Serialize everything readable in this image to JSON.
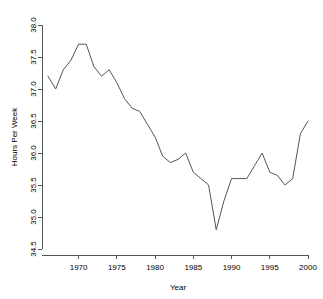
{
  "chart_data": {
    "type": "line",
    "title": "",
    "xlabel": "Year",
    "ylabel": "Hours Per Week",
    "xlim": [
      1966,
      2000
    ],
    "ylim": [
      34.5,
      38.0
    ],
    "grid": false,
    "legend": null,
    "xticks": [
      1970,
      1975,
      1980,
      1985,
      1990,
      1995,
      2000
    ],
    "xtick_labels": [
      "1970",
      "1975",
      "1980",
      "1985",
      "1990",
      "1995",
      "2000"
    ],
    "yticks": [
      34.5,
      35.0,
      35.5,
      36.0,
      36.5,
      37.0,
      37.5,
      38.0
    ],
    "ytick_labels": [
      "34.5",
      "35.0",
      "35.5",
      "36.0",
      "36.5",
      "37.0",
      "37.5",
      "38.0"
    ],
    "line_color": "#555555",
    "x": [
      1966,
      1967,
      1968,
      1969,
      1970,
      1971,
      1972,
      1973,
      1974,
      1975,
      1976,
      1977,
      1978,
      1979,
      1980,
      1981,
      1982,
      1983,
      1984,
      1985,
      1986,
      1987,
      1988,
      1989,
      1990,
      1991,
      1992,
      1993,
      1994,
      1995,
      1996,
      1997,
      1998,
      1999,
      2000
    ],
    "values": [
      37.2,
      37.0,
      37.3,
      37.45,
      37.7,
      37.7,
      37.35,
      37.2,
      37.3,
      37.1,
      36.85,
      36.7,
      36.65,
      36.45,
      36.25,
      35.95,
      35.85,
      35.9,
      36.0,
      35.7,
      35.6,
      35.5,
      34.8,
      35.25,
      35.6,
      35.6,
      35.6,
      35.8,
      36.0,
      35.7,
      35.65,
      35.5,
      35.6,
      36.3,
      36.5
    ],
    "series": [
      {
        "name": "Hours Per Week",
        "values": [
          37.2,
          37.0,
          37.3,
          37.45,
          37.7,
          37.7,
          37.35,
          37.2,
          37.3,
          37.1,
          36.85,
          36.7,
          36.65,
          36.45,
          36.25,
          35.95,
          35.85,
          35.9,
          36.0,
          35.7,
          35.6,
          35.5,
          34.8,
          35.25,
          35.6,
          35.6,
          35.6,
          35.8,
          36.0,
          35.7,
          35.65,
          35.5,
          35.6,
          36.3,
          36.5
        ]
      }
    ]
  }
}
